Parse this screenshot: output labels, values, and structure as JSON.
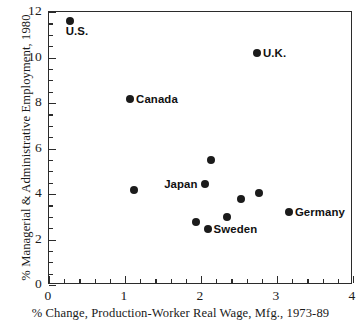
{
  "chart_data": {
    "type": "scatter",
    "title": "",
    "xlabel": "% Change, Production-Worker Real Wage, Mfg., 1973-89",
    "ylabel": "% Managerial & Administrative Employment, 1980",
    "xlim": [
      0,
      4
    ],
    "ylim": [
      0,
      12
    ],
    "xticks": [
      0,
      1,
      2,
      3,
      4
    ],
    "yticks": [
      0,
      2,
      4,
      6,
      8,
      10,
      12
    ],
    "xtick_labels": [
      "0",
      "1",
      "2",
      "3",
      "4"
    ],
    "ytick_labels": [
      "0",
      "2",
      "4",
      "6",
      "8",
      "10",
      "12"
    ],
    "x_minor_step": 0.2,
    "y_minor_step": 0.5,
    "grid": false,
    "legend": "none",
    "marker": "filled-circle",
    "marker_color": "#1b1b1b",
    "axis_color": "#2b2b2b",
    "background": "#ffffff",
    "points": [
      {
        "label": "U.S.",
        "x": 0.29,
        "y": 11.56,
        "label_pos": "below"
      },
      {
        "label": "U.K.",
        "x": 2.75,
        "y": 10.15,
        "label_pos": "right"
      },
      {
        "label": "Canada",
        "x": 1.08,
        "y": 8.13,
        "label_pos": "right"
      },
      {
        "label": "",
        "x": 2.15,
        "y": 5.45,
        "label_pos": "right"
      },
      {
        "label": "Japan",
        "x": 2.06,
        "y": 4.4,
        "label_pos": "left"
      },
      {
        "label": "",
        "x": 1.13,
        "y": 4.13,
        "label_pos": "right"
      },
      {
        "label": "",
        "x": 2.77,
        "y": 4.0,
        "label_pos": "right"
      },
      {
        "label": "",
        "x": 2.54,
        "y": 3.74,
        "label_pos": "right"
      },
      {
        "label": "Germany",
        "x": 3.17,
        "y": 3.16,
        "label_pos": "right"
      },
      {
        "label": "",
        "x": 2.35,
        "y": 2.95,
        "label_pos": "right"
      },
      {
        "label": "",
        "x": 1.95,
        "y": 2.73,
        "label_pos": "right"
      },
      {
        "label": "Sweden",
        "x": 2.1,
        "y": 2.42,
        "label_pos": "right"
      }
    ]
  }
}
